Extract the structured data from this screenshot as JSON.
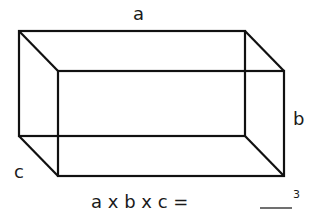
{
  "diagram": {
    "type": "rectangular-prism",
    "labels": {
      "length": "a",
      "height": "b",
      "depth": "c"
    },
    "formula": "a x b x c =",
    "answer_blank": "",
    "unit_exponent": "3"
  }
}
